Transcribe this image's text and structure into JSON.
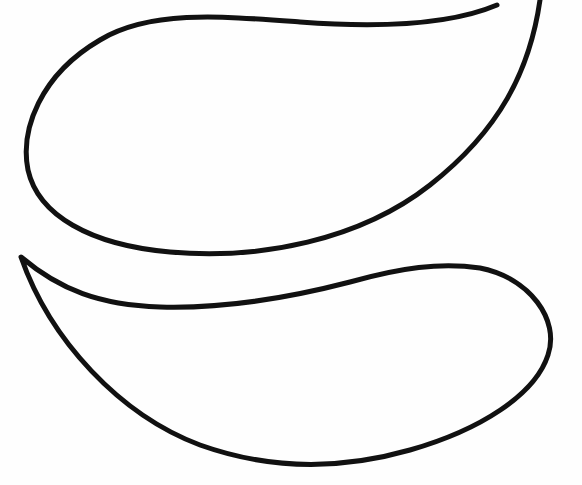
{
  "drawing": {
    "description": "Two paisley/teardrop outline shapes, black line art on white",
    "stroke_color": "#111111",
    "background_color": "#fefefe",
    "shapes": [
      {
        "name": "upper-paisley",
        "path": "M 497 5 C 450 25, 380 28, 300 22 C 220 16, 150 10, 100 40 C 40 75, 20 130, 28 170 C 38 215, 90 245, 170 252 C 260 260, 360 240, 430 185 C 500 130, 530 70, 540 0"
      },
      {
        "name": "lower-paisley",
        "path": "M 21 257 C 60 290, 100 305, 160 307 C 230 309, 300 295, 350 282 C 400 268, 440 262, 480 268 C 530 278, 560 320, 548 355 C 535 395, 480 430, 410 450 C 340 470, 270 470, 200 445 C 120 415, 50 340, 21 257 Z"
      }
    ]
  }
}
